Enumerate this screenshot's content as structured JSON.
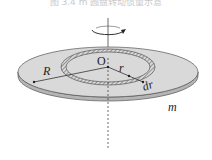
{
  "caption": {
    "text": "图 3.4    m 圆盘转动惯量示意"
  },
  "diagram": {
    "labels": {
      "center": "O",
      "outer_radius": "R",
      "ring_radius": "r",
      "ring_width": "dr",
      "mass": "m"
    },
    "colors": {
      "disk_top": "#d9d9d9",
      "disk_edge": "#b5b5b5",
      "outline": "#555555",
      "ring_hatch": "#777777"
    }
  }
}
